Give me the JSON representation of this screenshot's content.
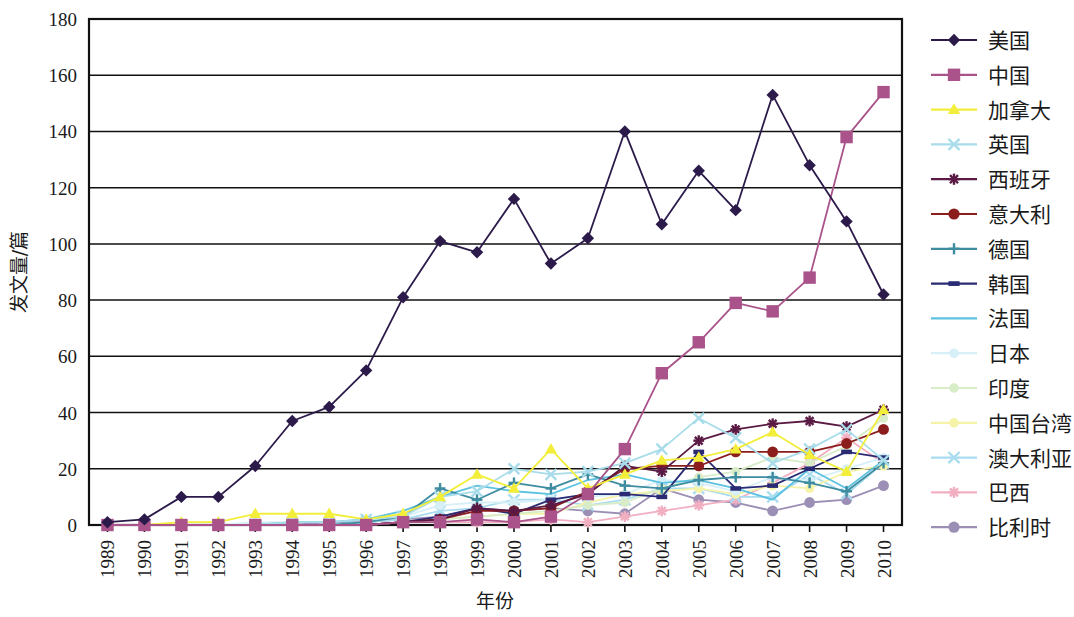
{
  "chart_data": {
    "type": "line",
    "title": "",
    "xlabel": "年份",
    "ylabel": "发文量/篇",
    "xlim": [
      1989,
      2010
    ],
    "ylim": [
      0,
      180
    ],
    "ytick_step": 20,
    "yticks": [
      "0",
      "20",
      "40",
      "60",
      "80",
      "100",
      "120",
      "140",
      "160",
      "180"
    ],
    "grid": "horizontal",
    "legend_position": "right",
    "x": [
      1989,
      1990,
      1991,
      1992,
      1993,
      1994,
      1995,
      1996,
      1997,
      1998,
      1999,
      2000,
      2001,
      2002,
      2003,
      2004,
      2005,
      2006,
      2007,
      2008,
      2009,
      2010
    ],
    "categories": [
      "1989",
      "1990",
      "1991",
      "1992",
      "1993",
      "1994",
      "1995",
      "1996",
      "1997",
      "1998",
      "1999",
      "2000",
      "2001",
      "2002",
      "2003",
      "2004",
      "2005",
      "2006",
      "2007",
      "2008",
      "2009",
      "2010"
    ],
    "series": [
      {
        "name": "美国",
        "color": "#2b1a4a",
        "marker": "diamond",
        "values": [
          1,
          2,
          10,
          10,
          21,
          37,
          42,
          55,
          81,
          101,
          97,
          116,
          93,
          102,
          140,
          107,
          126,
          112,
          153,
          128,
          108,
          82
        ]
      },
      {
        "name": "中国",
        "color": "#a9538a",
        "marker": "square",
        "values": [
          0,
          0,
          0,
          0,
          0,
          0,
          0,
          0,
          1,
          1,
          2,
          1,
          3,
          11,
          27,
          54,
          65,
          79,
          76,
          88,
          138,
          154
        ]
      },
      {
        "name": "加拿大",
        "color": "#f2ee3a",
        "marker": "triangle",
        "values": [
          0,
          0,
          1,
          1,
          4,
          4,
          4,
          2,
          4,
          10,
          18,
          13,
          27,
          13,
          18,
          23,
          24,
          27,
          33,
          25,
          19,
          41
        ]
      },
      {
        "name": "英国",
        "color": "#a8dcea",
        "marker": "x",
        "values": [
          0,
          0,
          0,
          0,
          0,
          1,
          1,
          2,
          3,
          10,
          12,
          20,
          18,
          19,
          22,
          27,
          38,
          31,
          22,
          27,
          34,
          23
        ]
      },
      {
        "name": "西班牙",
        "color": "#5b1a44",
        "marker": "asterisk",
        "values": [
          0,
          0,
          0,
          0,
          0,
          0,
          0,
          0,
          1,
          2,
          6,
          5,
          7,
          11,
          21,
          19,
          30,
          34,
          36,
          37,
          35,
          41
        ]
      },
      {
        "name": "意大利",
        "color": "#8c1d1d",
        "marker": "circle",
        "values": [
          0,
          0,
          0,
          0,
          0,
          0,
          0,
          0,
          1,
          2,
          5,
          5,
          6,
          12,
          20,
          21,
          21,
          26,
          26,
          26,
          29,
          34
        ]
      },
      {
        "name": "德国",
        "color": "#3e8ca0",
        "marker": "plus",
        "values": [
          0,
          0,
          0,
          0,
          0,
          0,
          0,
          1,
          3,
          13,
          9,
          15,
          13,
          18,
          14,
          13,
          16,
          17,
          17,
          15,
          12,
          22
        ]
      },
      {
        "name": "韩国",
        "color": "#2a2a75",
        "marker": "dash",
        "values": [
          0,
          0,
          0,
          0,
          0,
          0,
          0,
          0,
          1,
          3,
          6,
          4,
          9,
          11,
          11,
          10,
          26,
          13,
          14,
          20,
          26,
          24
        ]
      },
      {
        "name": "法国",
        "color": "#5cc2e0",
        "marker": "line",
        "values": [
          0,
          0,
          0,
          0,
          0,
          1,
          1,
          2,
          5,
          10,
          14,
          12,
          11,
          16,
          18,
          15,
          16,
          13,
          9,
          20,
          13,
          23
        ]
      },
      {
        "name": "日本",
        "color": "#d7f0f8",
        "marker": "dot",
        "values": [
          0,
          0,
          0,
          0,
          1,
          1,
          1,
          2,
          3,
          7,
          8,
          8,
          9,
          10,
          11,
          16,
          15,
          12,
          17,
          16,
          20,
          24
        ]
      },
      {
        "name": "印度",
        "color": "#d8ecc8",
        "marker": "dot",
        "values": [
          0,
          0,
          0,
          0,
          0,
          0,
          0,
          0,
          1,
          2,
          3,
          4,
          5,
          7,
          8,
          13,
          17,
          19,
          24,
          22,
          28,
          38
        ]
      },
      {
        "name": "中国台湾",
        "color": "#f5f3a8",
        "marker": "dot",
        "values": [
          0,
          0,
          0,
          0,
          0,
          0,
          0,
          0,
          1,
          2,
          3,
          4,
          4,
          8,
          11,
          12,
          13,
          11,
          14,
          13,
          19,
          21
        ]
      },
      {
        "name": "澳大利亚",
        "color": "#a9dcef",
        "marker": "x",
        "values": [
          0,
          0,
          0,
          0,
          0,
          0,
          0,
          1,
          2,
          5,
          6,
          9,
          9,
          7,
          9,
          13,
          13,
          10,
          10,
          18,
          11,
          22
        ]
      },
      {
        "name": "巴西",
        "color": "#f2afc2",
        "marker": "asterisk",
        "values": [
          0,
          0,
          0,
          0,
          0,
          0,
          0,
          0,
          1,
          1,
          1,
          1,
          2,
          1,
          3,
          5,
          7,
          9,
          15,
          22,
          31,
          22
        ]
      },
      {
        "name": "比利时",
        "color": "#9b8fb5",
        "marker": "circle",
        "values": [
          0,
          0,
          0,
          0,
          0,
          0,
          1,
          1,
          2,
          3,
          6,
          5,
          6,
          5,
          4,
          13,
          9,
          8,
          5,
          8,
          9,
          14
        ]
      }
    ]
  },
  "axes": {
    "y_label": "发文量/篇",
    "x_label": "年份"
  }
}
